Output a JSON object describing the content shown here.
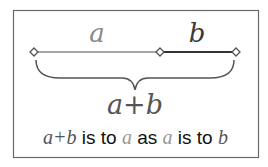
{
  "diagram": {
    "label_a": "a",
    "label_b": "b",
    "label_sum": "a+b",
    "caption": {
      "part1": "a+b",
      "part2": " is to ",
      "part3": "a",
      "part4": " as ",
      "part5": "a",
      "part6": " is to ",
      "part7": "b"
    },
    "colors": {
      "a": "#8a8a8a",
      "b": "#3a3a3a",
      "sum": "#555555",
      "frame": "#6a6a6a"
    }
  }
}
